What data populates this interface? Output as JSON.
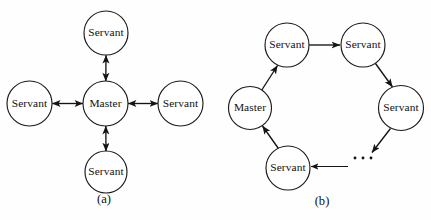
{
  "figure": {
    "background_color": "#fefefe",
    "stroke_color": "#141414",
    "label_color": "#111111",
    "width": 431,
    "height": 220
  },
  "panels": [
    {
      "id": "panel-a",
      "caption": "(a)",
      "caption_x": 104,
      "caption_y": 200,
      "topology": "star",
      "arrow_style": "bidirectional",
      "nodes": [
        {
          "id": "a-master",
          "label": "Master",
          "role": "master",
          "cx": 105.5,
          "cy": 103.5,
          "r": 22.5
        },
        {
          "id": "a-north",
          "label": "Servant",
          "role": "servant",
          "cx": 106,
          "cy": 33,
          "r": 22.0
        },
        {
          "id": "a-west",
          "label": "Servant",
          "role": "servant",
          "cx": 29.5,
          "cy": 103.5,
          "r": 22.5
        },
        {
          "id": "a-east",
          "label": "Servant",
          "role": "servant",
          "cx": 180.5,
          "cy": 103.5,
          "r": 22.5
        },
        {
          "id": "a-south",
          "label": "Servant",
          "role": "servant",
          "cx": 106,
          "cy": 172,
          "r": 21.0
        }
      ],
      "edges": [
        {
          "id": "a-edge-north",
          "from": "a-master",
          "to": "a-north",
          "directed": "both"
        },
        {
          "id": "a-edge-west",
          "from": "a-master",
          "to": "a-west",
          "directed": "both"
        },
        {
          "id": "a-edge-east",
          "from": "a-master",
          "to": "a-east",
          "directed": "both"
        },
        {
          "id": "a-edge-south",
          "from": "a-master",
          "to": "a-south",
          "directed": "both"
        }
      ]
    },
    {
      "id": "panel-b",
      "caption": "(b)",
      "caption_x": 322,
      "caption_y": 202,
      "topology": "ring",
      "arrow_style": "directed",
      "nodes": [
        {
          "id": "b-master",
          "label": "Master",
          "role": "master",
          "cx": 250,
          "cy": 108,
          "r": 21.5
        },
        {
          "id": "b-top-left",
          "label": "Servant",
          "role": "servant",
          "cx": 287,
          "cy": 45,
          "r": 22.0
        },
        {
          "id": "b-top-right",
          "label": "Servant",
          "role": "servant",
          "cx": 363,
          "cy": 45,
          "r": 22.0
        },
        {
          "id": "b-right",
          "label": "Servant",
          "role": "servant",
          "cx": 401,
          "cy": 108,
          "r": 22.5
        },
        {
          "id": "b-bottom",
          "label": "Servant",
          "role": "servant",
          "cx": 288,
          "cy": 168,
          "r": 22.0
        }
      ],
      "edges": [
        {
          "id": "b-edge-1",
          "from": "b-master",
          "to": "b-top-left",
          "directed": "forward"
        },
        {
          "id": "b-edge-2",
          "from": "b-top-left",
          "to": "b-top-right",
          "directed": "forward"
        },
        {
          "id": "b-edge-3",
          "from": "b-top-right",
          "to": "b-right",
          "directed": "forward"
        },
        {
          "id": "b-edge-4",
          "from": "b-right",
          "to": "ellipsis",
          "directed": "forward"
        },
        {
          "id": "b-edge-5",
          "from": "ellipsis",
          "to": "b-bottom",
          "directed": "forward"
        },
        {
          "id": "b-edge-6",
          "from": "b-bottom",
          "to": "b-master",
          "directed": "forward"
        }
      ],
      "ellipsis": {
        "id": "b-ellipsis",
        "text": "...",
        "dots": 3,
        "x": 356,
        "y": 158,
        "spacing": 8
      }
    }
  ]
}
